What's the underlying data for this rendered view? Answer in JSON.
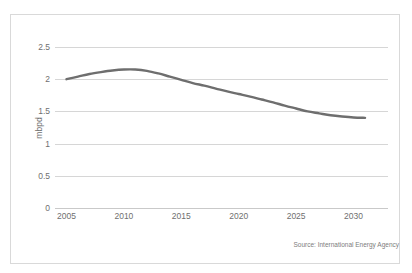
{
  "figure": {
    "clipped_caption": "",
    "source_note": "Source: International Energy Agency"
  },
  "chart_data": {
    "type": "line",
    "title": "",
    "subtitle": "",
    "xlabel": "",
    "ylabel": "mbpd",
    "xlim": [
      2004,
      2033
    ],
    "ylim": [
      0,
      2.5
    ],
    "grid": true,
    "legend": false,
    "legend_position": "none",
    "y_ticks": [
      2.5,
      2,
      1.5,
      1,
      0.5,
      0
    ],
    "y_tick_labels": [
      "2.5",
      "2",
      "1.5",
      "1",
      "0.5",
      "0"
    ],
    "x_ticks": [
      2005,
      2010,
      2015,
      2020,
      2025,
      2030
    ],
    "x_tick_labels": [
      "2005",
      "2010",
      "2015",
      "2020",
      "2025",
      "2030"
    ],
    "line_color": "#6e6e6e",
    "line_width": 2.4,
    "x": [
      2005,
      2006,
      2007,
      2008,
      2009,
      2010,
      2011,
      2012,
      2013,
      2014,
      2015,
      2016,
      2017,
      2018,
      2019,
      2020,
      2021,
      2022,
      2023,
      2024,
      2025,
      2026,
      2027,
      2028,
      2029,
      2030,
      2031
    ],
    "values": [
      2.0,
      2.04,
      2.08,
      2.11,
      2.135,
      2.15,
      2.15,
      2.13,
      2.09,
      2.04,
      1.99,
      1.94,
      1.9,
      1.855,
      1.81,
      1.77,
      1.73,
      1.685,
      1.64,
      1.59,
      1.545,
      1.5,
      1.47,
      1.44,
      1.42,
      1.405,
      1.4
    ],
    "series": [
      {
        "name": "mbpd",
        "values": [
          2.0,
          2.04,
          2.08,
          2.11,
          2.135,
          2.15,
          2.15,
          2.13,
          2.09,
          2.04,
          1.99,
          1.94,
          1.9,
          1.855,
          1.81,
          1.77,
          1.73,
          1.685,
          1.64,
          1.59,
          1.545,
          1.5,
          1.47,
          1.44,
          1.42,
          1.405,
          1.4
        ]
      }
    ],
    "annotations": []
  }
}
